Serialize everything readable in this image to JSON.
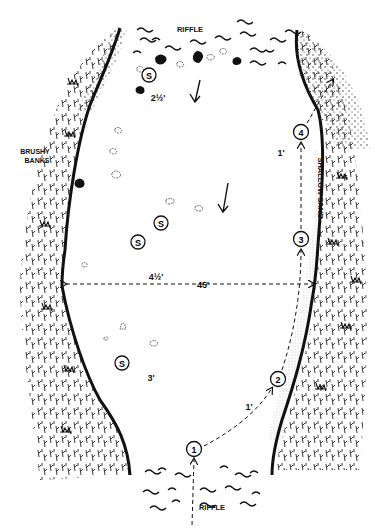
{
  "labels": {
    "riffle_top": "RIFFLE",
    "riffle_bottom": "RIFFLE",
    "brushy_line1": "BRUSHY",
    "brushy_line2": "BANKS",
    "shallow_sand": "SHALLOW SAND",
    "width": "45'",
    "depth_top": "2½'",
    "depth_center": "4½'",
    "depth_lower": "3'",
    "depth_right_upper": "1'",
    "depth_right_lower": "1'"
  },
  "stones": [
    {
      "id": "s1",
      "symbol": "S",
      "x": 149,
      "y": 75
    },
    {
      "id": "s2",
      "symbol": "S",
      "x": 161,
      "y": 223
    },
    {
      "id": "s3",
      "symbol": "S",
      "x": 138,
      "y": 242
    },
    {
      "id": "s4",
      "symbol": "S",
      "x": 122,
      "y": 363
    }
  ],
  "positions": [
    {
      "id": "p1",
      "label": "1",
      "x": 194,
      "y": 449
    },
    {
      "id": "p2",
      "label": "2",
      "x": 278,
      "y": 379
    },
    {
      "id": "p3",
      "label": "3",
      "x": 301,
      "y": 239
    },
    {
      "id": "p4",
      "label": "4",
      "x": 301,
      "y": 132
    }
  ],
  "colors": {
    "ink": "#111111",
    "background": "#ffffff",
    "sand": "#bbbbbb"
  }
}
